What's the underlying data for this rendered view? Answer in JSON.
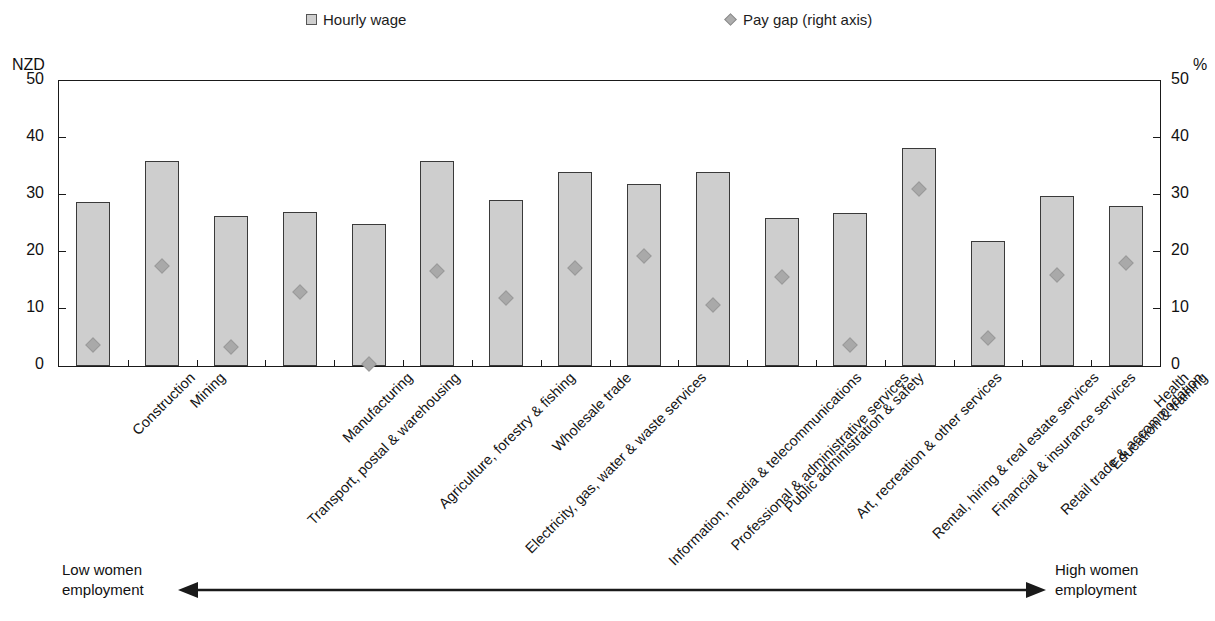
{
  "legend": {
    "items": [
      {
        "label": "Hourly wage",
        "marker": "square-icon",
        "color": "#cfcfcf"
      },
      {
        "label": "Pay gap (right axis)",
        "marker": "diamond-icon",
        "color": "#a9a9a9"
      }
    ]
  },
  "annotation": {
    "left_line1": "Low women",
    "left_line2": "employment",
    "right_line1": "High women",
    "right_line2": "employment",
    "arrow": "double-headed-arrow-icon"
  },
  "chart_data": {
    "type": "bar",
    "title": "",
    "xlabel": "",
    "ylabel": "NZD",
    "y2label": "%",
    "ylim": [
      0,
      50
    ],
    "y2lim": [
      0,
      50
    ],
    "yticks": [
      0,
      10,
      20,
      30,
      40,
      50
    ],
    "y2ticks": [
      0,
      10,
      20,
      30,
      40,
      50
    ],
    "grid": false,
    "legend_position": "top",
    "categories": [
      "Construction",
      "Mining",
      "Transport, postal & warehousing",
      "Manufacturing",
      "Agriculture, forestry & fishing",
      "Electricity, gas, water & waste services",
      "Wholesale trade",
      "Information, media & telecommunications",
      "Professional & administrative services",
      "Public administration & safety",
      "Art, recreation & other services",
      "Rental, hiring & real estate services",
      "Financial & insurance services",
      "Retail trade & accommodation",
      "Education & training",
      "Health"
    ],
    "series": [
      {
        "name": "Hourly wage",
        "axis": "left",
        "unit": "NZD",
        "type": "bar",
        "values": [
          28.7,
          36.0,
          26.3,
          27.0,
          25.0,
          36.0,
          29.1,
          34.0,
          32.0,
          34.1,
          25.9,
          26.8,
          38.3,
          21.9,
          29.8,
          28.0
        ]
      },
      {
        "name": "Pay gap (right axis)",
        "axis": "right",
        "unit": "%",
        "type": "scatter",
        "values": [
          3.7,
          17.6,
          3.3,
          13.0,
          0.3,
          16.7,
          11.9,
          17.2,
          19.3,
          10.7,
          15.7,
          3.7,
          31.0,
          5.0,
          15.9,
          18.1
        ]
      }
    ]
  }
}
